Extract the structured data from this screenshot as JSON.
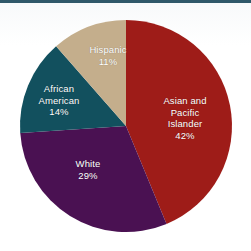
{
  "figure": {
    "background_color": "#ffffff",
    "top_rule_color": "#1d4a5c"
  },
  "chart_data": {
    "type": "pie",
    "title": "",
    "subtitle": "",
    "xlabel": "",
    "ylabel": "",
    "legend_position": "none",
    "grid": false,
    "start_angle_deg": 0,
    "direction": "clockwise",
    "units": "percent",
    "categories": [
      "Asian and Pacific Islander",
      "White",
      "African American",
      "Hispanic"
    ],
    "values": [
      42,
      29,
      14,
      11
    ],
    "colors": [
      "#9e1c18",
      "#4a1152",
      "#12505e",
      "#c4ae8c"
    ],
    "slices": [
      {
        "label": "Asian and Pacific Islander",
        "label_lines": [
          "Asian and",
          "Pacific",
          "Islander"
        ],
        "value": 42,
        "value_text": "42%",
        "color": "#9e1c18",
        "label_color": "#ffffff"
      },
      {
        "label": "White",
        "label_lines": [
          "White"
        ],
        "value": 29,
        "value_text": "29%",
        "color": "#4a1152",
        "label_color": "#ffffff"
      },
      {
        "label": "African American",
        "label_lines": [
          "African",
          "American"
        ],
        "value": 14,
        "value_text": "14%",
        "color": "#12505e",
        "label_color": "#ffffff"
      },
      {
        "label": "Hispanic",
        "label_lines": [
          "Hispanic"
        ],
        "value": 11,
        "value_text": "11%",
        "color": "#c4ae8c",
        "label_color": "#ffffff"
      }
    ]
  },
  "labels": {
    "asian": {
      "line1": "Asian and",
      "line2": "Pacific",
      "line3": "Islander",
      "pct": "42%"
    },
    "white": {
      "line1": "White",
      "pct": "29%"
    },
    "african": {
      "line1": "African",
      "line2": "American",
      "pct": "14%"
    },
    "hispanic": {
      "line1": "Hispanic",
      "pct": "11%"
    }
  }
}
